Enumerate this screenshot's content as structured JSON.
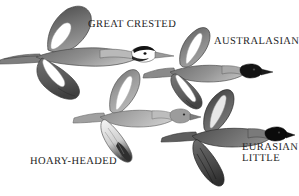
{
  "plate": {
    "width": 299,
    "height": 196,
    "background_color": "#ffffff",
    "medium": "grayscale-illustration",
    "subject": "four grebe species in flight"
  },
  "labels": {
    "great_crested": "GREAT CRESTED",
    "australasian": "AUSTRALASIAN",
    "hoary_headed": "HOARY-HEADED",
    "eurasian_little_line1": "EURASIAN",
    "eurasian_little_line2": "LITTLE"
  },
  "birds": [
    {
      "id": "great-crested",
      "name": "Great Crested Grebe",
      "position": "upper-left",
      "size": "largest",
      "head": "dark crest with white face and cheek",
      "bill": "long pointed pale bill",
      "plumage": "dark grey-brown upperparts with bold white wing patches",
      "wing_upstroke": true
    },
    {
      "id": "australasian",
      "name": "Australasian Grebe",
      "position": "upper-right",
      "size": "small",
      "head": "dark blackish head",
      "bill": "short pointed dark bill",
      "plumage": "grey-brown body with white leading-edge wing stripe",
      "wing_upstroke": true
    },
    {
      "id": "hoary-headed",
      "name": "Hoary-headed Grebe",
      "position": "center-lower",
      "size": "small",
      "head": "pale grey head",
      "bill": "short pointed bill",
      "plumage": "pale grey body with white underwing and dark wingtips",
      "wing_upstroke": true
    },
    {
      "id": "eurasian-little",
      "name": "Eurasian Little Grebe",
      "position": "lower-right",
      "size": "small",
      "head": "black head",
      "bill": "short dark bill",
      "plumage": "darkest body, uniform dark brown wings",
      "wing_upstroke": true
    }
  ],
  "colors": {
    "ink_dark": "#2a2a2a",
    "ink_black": "#111111",
    "grey_mid": "#8d8d8d",
    "grey_light": "#c9c9c9",
    "grey_pale": "#e3e3e3",
    "white": "#ffffff",
    "text": "#1d1d1d"
  }
}
